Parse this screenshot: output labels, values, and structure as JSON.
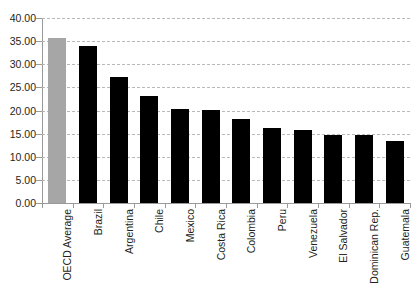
{
  "chart_data": {
    "type": "bar",
    "title": "",
    "subtitle": "",
    "xlabel": "",
    "ylabel": "",
    "ylim": [
      0,
      40
    ],
    "ytick_step": 5,
    "ytick_labels": [
      "0.00",
      "5.00",
      "10.00",
      "15.00",
      "20.00",
      "25.00",
      "30.00",
      "35.00",
      "40.00"
    ],
    "ytick_values": [
      0,
      5,
      10,
      15,
      20,
      25,
      30,
      35,
      40
    ],
    "grid": true,
    "grid_axis": "y",
    "legend": false,
    "legend_position": "none",
    "categories": [
      "OECD Average",
      "Brazil",
      "Argentina",
      "Chile",
      "Mexico",
      "Costa Rica",
      "Colombia",
      "Peru",
      "Venezuela",
      "El Salvador",
      "Dominican Rep.",
      "Guatemala"
    ],
    "values": [
      35.7,
      33.9,
      27.2,
      23.1,
      20.3,
      20.1,
      18.1,
      16.3,
      15.8,
      14.7,
      14.6,
      13.5
    ],
    "bar_colors": [
      "#a6a6a6",
      "#000000",
      "#000000",
      "#000000",
      "#000000",
      "#000000",
      "#000000",
      "#000000",
      "#000000",
      "#000000",
      "#000000",
      "#000000"
    ],
    "highlight_category": "OECD Average",
    "highlight_color": "#a6a6a6",
    "series_color": "#000000",
    "gridline_color": "#b9b9b9",
    "axis_color": "#9a9a9a",
    "xtick_label_rotation": -90
  }
}
